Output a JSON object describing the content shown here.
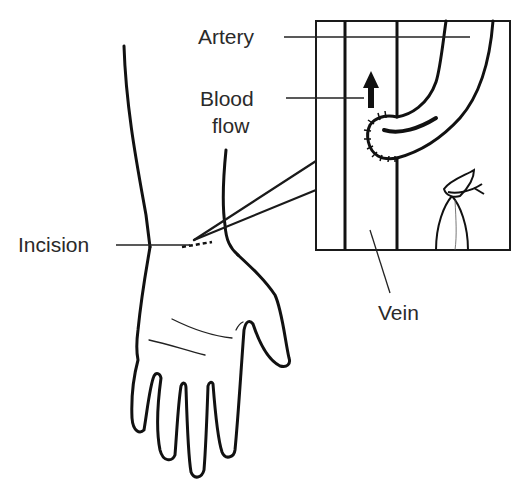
{
  "diagram": {
    "labels": {
      "artery": "Artery",
      "blood_flow_line1": "Blood",
      "blood_flow_line2": "flow",
      "incision": "Incision",
      "vein": "Vein"
    },
    "colors": {
      "line": "#111111",
      "text": "#2a2a2a",
      "background": "#ffffff"
    }
  }
}
